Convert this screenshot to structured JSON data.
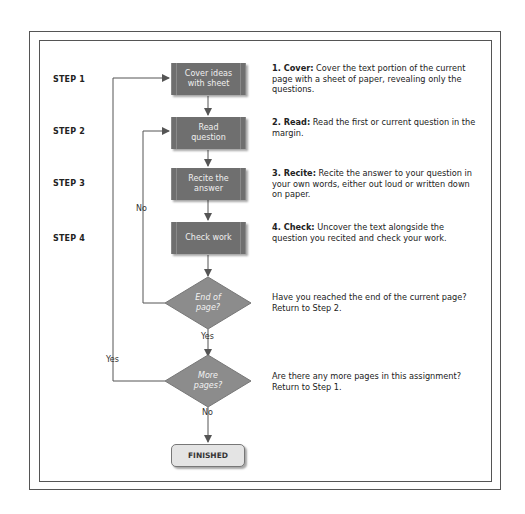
{
  "steps": [
    {
      "label": "STEP 1",
      "box": "Cover ideas with sheet",
      "box_lines": [
        "Cover ideas",
        "with sheet"
      ],
      "term": "1. Cover:",
      "desc": " Cover the text portion of the current page with a sheet of paper, revealing only the questions."
    },
    {
      "label": "STEP 2",
      "box": "Read question",
      "box_lines": [
        "Read",
        "question"
      ],
      "term": "2. Read:",
      "desc": " Read the first or current question in the margin."
    },
    {
      "label": "STEP 3",
      "box": "Recite the answer",
      "box_lines": [
        "Recite the",
        "answer"
      ],
      "term": "3. Recite:",
      "desc": " Recite the answer to your question in your own words, either out loud or written down on paper."
    },
    {
      "label": "STEP 4",
      "box": "Check work",
      "box_lines": [
        "Check work"
      ],
      "term": "4. Check:",
      "desc": " Uncover the text alongside the question you recited and check your work."
    }
  ],
  "decisions": [
    {
      "lines": [
        "End of",
        "page?"
      ],
      "desc": "Have you reached the end of the current page? Return to Step 2.",
      "no_label": "No",
      "yes_label": "Yes"
    },
    {
      "lines": [
        "More",
        "pages?"
      ],
      "desc": "Are there any more pages in this assignment? Return to Step 1.",
      "yes_label": "Yes",
      "no_label": "No"
    }
  ],
  "end": {
    "label": "FINISHED"
  },
  "colors": {
    "box_fill": "#6f6f6f",
    "diamond_fill": "#8c8c8c",
    "end_fill": "#e4e4e4",
    "line": "#555555"
  }
}
